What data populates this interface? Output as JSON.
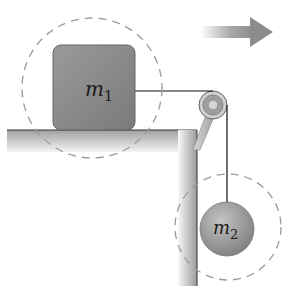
{
  "diagram": {
    "masses": {
      "m1": {
        "label_base": "m",
        "label_sub": "1",
        "shape": "block"
      },
      "m2": {
        "label_base": "m",
        "label_sub": "2",
        "shape": "sphere"
      }
    },
    "elements": [
      "table",
      "pulley",
      "string",
      "direction-arrow",
      "system-boundary-m1",
      "system-boundary-m2"
    ],
    "arrow_direction": "right",
    "colors": {
      "block": "#8a8a8a",
      "sphere": "#9a9a9a",
      "table": "#b5b5b5",
      "dashed": "#9a9a9a",
      "string": "#111111",
      "arrow": "#8c8c8c"
    }
  }
}
